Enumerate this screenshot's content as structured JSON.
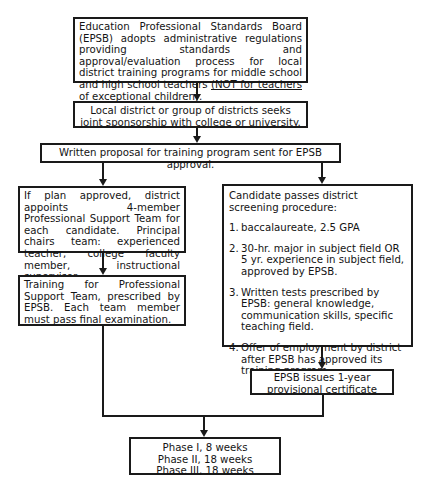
{
  "diagram": {
    "type": "flowchart",
    "nodes": {
      "epsb_adopts": {
        "text_main": "Education Professional Standards Board (EPSB) adopts administrative regulations providing standards and approval/evaluation process for local district training programs for middle school and high school teachers ",
        "text_underlined": "(NOT for teachers of exceptional children)",
        "text_end": "."
      },
      "joint_sponsorship": {
        "text": "Local district or group of districts seeks joint sponsorship with college or university."
      },
      "written_proposal": {
        "text": "Written proposal for training program sent for EPSB approval."
      },
      "support_team": {
        "text": "If plan approved, district appoints 4-member Professional Support Team for each candidate.  Principal chairs team:  experienced teacher, college faculty member, instructional supervisor."
      },
      "screening": {
        "heading": "Candidate passes district screening procedure:",
        "items": [
          {
            "num": "1.",
            "text": "baccalaureate, 2.5 GPA"
          },
          {
            "num": "2.",
            "text": "30-hr. major in subject field OR 5 yr. experience in subject field, approved by EPSB."
          },
          {
            "num": "3.",
            "text": "Written tests prescribed by EPSB: general knowledge, communication skills, specific teaching field."
          },
          {
            "num": "4.",
            "text": "Offer of employment by district after EPSB has approved its training program."
          }
        ]
      },
      "team_training": {
        "text": "Training for Professional Support Team, prescribed by EPSB.  Each team member must pass final examination."
      },
      "provisional_certificate": {
        "text": "EPSB issues 1-year provisional certificate"
      },
      "phases": {
        "lines": [
          "Phase I, 8 weeks",
          "Phase II, 18 weeks",
          "Phase III, 18 weeks"
        ]
      }
    },
    "edges": [
      [
        "epsb_adopts",
        "joint_sponsorship"
      ],
      [
        "joint_sponsorship",
        "written_proposal"
      ],
      [
        "written_proposal",
        "support_team"
      ],
      [
        "written_proposal",
        "screening"
      ],
      [
        "support_team",
        "team_training"
      ],
      [
        "screening",
        "provisional_certificate"
      ],
      [
        "team_training",
        "phases"
      ],
      [
        "provisional_certificate",
        "phases"
      ]
    ]
  }
}
